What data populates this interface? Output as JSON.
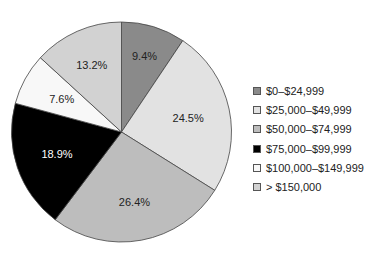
{
  "chart_data": {
    "type": "pie",
    "title": "",
    "categories": [
      "$0–$24,999",
      "$25,000–$49,999",
      "$50,000–$74,999",
      "$75,000–$99,999",
      "$100,000–$149,999",
      "> $150,000"
    ],
    "values": [
      9.4,
      24.5,
      26.4,
      18.9,
      7.6,
      13.2
    ],
    "labels": [
      "9.4%",
      "24.5%",
      "26.4%",
      "18.9%",
      "7.6%",
      "13.2%"
    ],
    "colors": [
      "#8a8a8a",
      "#e2e2e2",
      "#bdbdbd",
      "#000000",
      "#f8f8f8",
      "#d2d2d2"
    ],
    "label_colors": [
      "#222222",
      "#222222",
      "#222222",
      "#ffffff",
      "#222222",
      "#222222"
    ],
    "start_angle": "12 o'clock, clockwise",
    "legend_position": "right"
  },
  "legend": [
    {
      "label": "$0–$24,999"
    },
    {
      "label": "$25,000–$49,999"
    },
    {
      "label": "$50,000–$74,999"
    },
    {
      "label": "$75,000–$99,999"
    },
    {
      "label": "$100,000–$149,999"
    },
    {
      "label": "> $150,000"
    }
  ]
}
